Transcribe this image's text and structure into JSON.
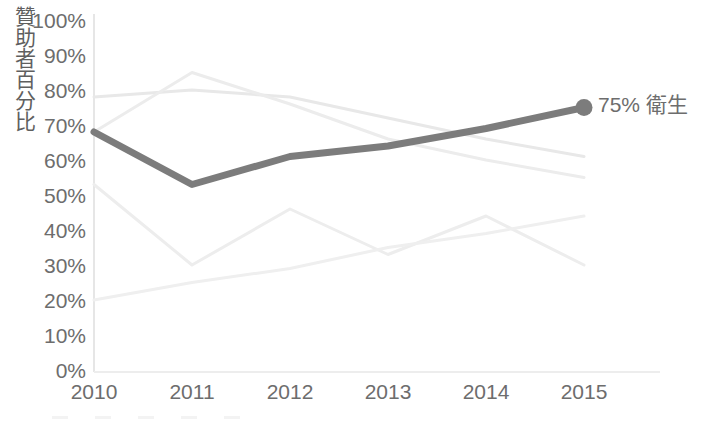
{
  "chart_data": {
    "type": "line",
    "title": "",
    "subtitle": "",
    "xlabel": "",
    "ylabel": "贊助者百分比",
    "x": [
      "2010",
      "2011",
      "2012",
      "2013",
      "2014",
      "2015"
    ],
    "categories": [
      "2010",
      "2011",
      "2012",
      "2013",
      "2014",
      "2015"
    ],
    "xlim": [
      2010,
      2015
    ],
    "ylim": [
      0,
      100
    ],
    "ytick_labels": [
      "100%",
      "90%",
      "80%",
      "70%",
      "60%",
      "50%",
      "40%",
      "30%",
      "20%",
      "10%",
      "0%"
    ],
    "ytick_values": [
      100,
      90,
      80,
      70,
      60,
      50,
      40,
      30,
      20,
      10,
      0
    ],
    "xtick_labels": [
      "2010",
      "2011",
      "2012",
      "2013",
      "2014",
      "2015"
    ],
    "grid": false,
    "legend_position": "bottom",
    "series": [
      {
        "name": "衛生",
        "highlighted": true,
        "color": "#7c7c7c",
        "width": 7,
        "values": [
          68,
          53,
          61,
          64,
          69,
          75
        ],
        "end_marker": true,
        "end_label": "75% 衛生"
      },
      {
        "name": "series-2",
        "highlighted": false,
        "color": "#e8e8e8",
        "width": 3,
        "values": [
          78,
          80,
          78,
          72,
          66,
          61
        ]
      },
      {
        "name": "series-3",
        "highlighted": false,
        "color": "#ececec",
        "width": 3,
        "values": [
          68,
          85,
          76,
          66,
          60,
          55
        ]
      },
      {
        "name": "series-4",
        "highlighted": false,
        "color": "#ededed",
        "width": 3,
        "values": [
          53,
          30,
          46,
          33,
          44,
          30
        ]
      },
      {
        "name": "series-5",
        "highlighted": false,
        "color": "#efefef",
        "width": 3,
        "values": [
          20,
          25,
          29,
          35,
          39,
          44
        ]
      }
    ],
    "annotations": [
      {
        "name": "end-point-callout",
        "text": "75% 衛生",
        "value": 75,
        "at_x": "2015"
      }
    ],
    "colors": {
      "highlight": "#7c7c7c",
      "muted": "#ececec",
      "text": "#6d6d6d",
      "axis": "#e3e3e3",
      "background": "#ffffff"
    }
  },
  "legend": {
    "items": [
      {
        "label": ""
      },
      {
        "label": ""
      },
      {
        "label": ""
      },
      {
        "label": ""
      },
      {
        "label": ""
      }
    ]
  }
}
